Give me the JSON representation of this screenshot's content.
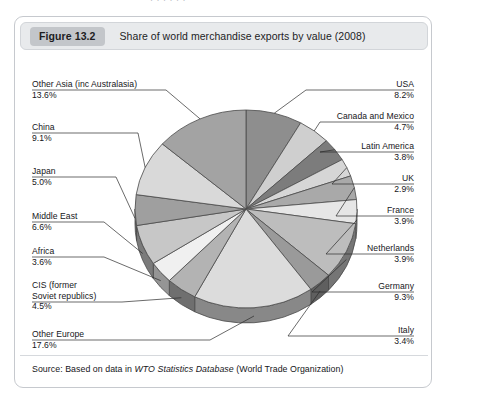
{
  "page": {
    "top_cut_text": "·   · ·     ·   · ·"
  },
  "figure": {
    "number_label": "Figure 13.2",
    "title": "Share of world merchandise exports by value (2008)",
    "source_prefix": "Source: Based on data in ",
    "source_italic": "WTO Statistics Database",
    "source_suffix": " (World Trade Organization)"
  },
  "chart_data": {
    "type": "pie",
    "title": "Share of world merchandise exports by value (2008)",
    "xlabel": "",
    "ylabel": "",
    "unit": "%",
    "three_d": true,
    "start_angle_deg": -90,
    "direction": "clockwise",
    "categories": [
      "USA",
      "Canada and Mexico",
      "Latin America",
      "UK",
      "France",
      "Netherlands",
      "Germany",
      "Italy",
      "Other Europe",
      "CIS (former Soviet republics)",
      "Africa",
      "Middle East",
      "Japan",
      "China",
      "Other Asia (inc Australasia)"
    ],
    "values": [
      8.2,
      4.7,
      3.8,
      2.9,
      3.9,
      3.9,
      9.3,
      3.4,
      17.6,
      4.5,
      3.6,
      6.6,
      5.0,
      9.1,
      13.6
    ],
    "slice_colors": [
      "#8e8e8e",
      "#cfcfcf",
      "#7c7c7c",
      "#d6d6d6",
      "#a9a9a9",
      "#e6e6e6",
      "#bdbdbd",
      "#9a9a9a",
      "#dcdcdc",
      "#b3b3b3",
      "#f0f0f0",
      "#c7c7c7",
      "#9f9f9f",
      "#d9d9d9",
      "#a3a3a3"
    ],
    "labels": [
      {
        "name": "USA",
        "percent": "8.2%"
      },
      {
        "name": "Canada and Mexico",
        "percent": "4.7%"
      },
      {
        "name": "Latin America",
        "percent": "3.8%"
      },
      {
        "name": "UK",
        "percent": "2.9%"
      },
      {
        "name": "France",
        "percent": "3.9%"
      },
      {
        "name": "Netherlands",
        "percent": "3.9%"
      },
      {
        "name": "Germany",
        "percent": "9.3%"
      },
      {
        "name": "Italy",
        "percent": "3.4%"
      },
      {
        "name": "Other Europe",
        "percent": "17.6%"
      },
      {
        "name": "CIS (former\nSoviet republics)",
        "percent": "4.5%"
      },
      {
        "name": "Africa",
        "percent": "3.6%"
      },
      {
        "name": "Middle East",
        "percent": "6.6%"
      },
      {
        "name": "Japan",
        "percent": "5.0%"
      },
      {
        "name": "China",
        "percent": "9.1%"
      },
      {
        "name": "Other Asia (inc Australasia)",
        "percent": "13.6%"
      }
    ],
    "legend_position": "callout-labels",
    "grid": false
  },
  "colors": {
    "header_bg": "#e8eaec",
    "number_badge": "#c3c6ca",
    "frame_border": "#c6c9ce",
    "text": "#16161a",
    "slice_outline": "#4a4a4a",
    "pie_side": "#777777"
  }
}
